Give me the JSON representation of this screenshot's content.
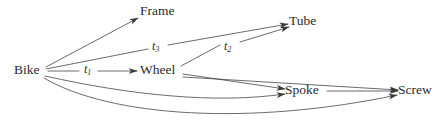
{
  "figure": {
    "kind": "directed-graph",
    "background_color": "#ffffff",
    "line_color": "#3a3a3a",
    "text_color": "#2b2b2b"
  },
  "nodes": [
    {
      "id": "bike",
      "label": "Bike",
      "x": 29,
      "y": 71
    },
    {
      "id": "frame",
      "label": "Frame",
      "x": 160,
      "y": 12
    },
    {
      "id": "wheel",
      "label": "Wheel",
      "x": 159,
      "y": 71
    },
    {
      "id": "tube",
      "label": "Tube",
      "x": 303,
      "y": 22
    },
    {
      "id": "spoke",
      "label": "Spoke",
      "x": 302,
      "y": 91
    },
    {
      "id": "screw",
      "label": "Screw",
      "x": 415,
      "y": 91
    }
  ],
  "edges": [
    {
      "id": "bike-frame",
      "from": "Bike",
      "to": "Frame",
      "label": ""
    },
    {
      "id": "bike-wheel",
      "from": "Bike",
      "to": "Wheel",
      "label": "t1"
    },
    {
      "id": "bike-tube",
      "from": "Bike",
      "to": "Tube",
      "label": "t3"
    },
    {
      "id": "bike-spoke",
      "from": "Bike",
      "to": "Spoke",
      "label": ""
    },
    {
      "id": "bike-screw",
      "from": "Bike",
      "to": "Screw",
      "label": ""
    },
    {
      "id": "wheel-tube",
      "from": "Wheel",
      "to": "Tube",
      "label": "t2"
    },
    {
      "id": "wheel-spoke",
      "from": "Wheel",
      "to": "Spoke",
      "label": ""
    },
    {
      "id": "wheel-screw",
      "from": "Wheel",
      "to": "Screw",
      "label": ""
    },
    {
      "id": "spoke-screw",
      "from": "Spoke",
      "to": "Screw",
      "label": ""
    }
  ],
  "edge_labels": [
    {
      "id": "t1",
      "base": "t",
      "sub": "1",
      "x": 88,
      "y": 70
    },
    {
      "id": "t3",
      "base": "t",
      "sub": "3",
      "x": 156,
      "y": 47
    },
    {
      "id": "t2",
      "base": "t",
      "sub": "2",
      "x": 228,
      "y": 47
    }
  ]
}
